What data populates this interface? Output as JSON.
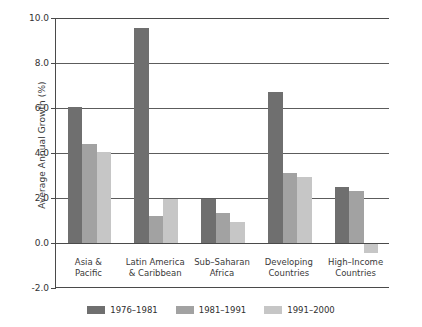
{
  "chart_data": {
    "type": "bar",
    "title": "",
    "xlabel": "",
    "ylabel": "Average Annual Growth (%)",
    "ylim": [
      -2.0,
      10.0
    ],
    "ytick_values": [
      10.0,
      8.0,
      6.0,
      4.0,
      2.0,
      0.0,
      -2.0
    ],
    "ytick_labels": [
      "10.0",
      "8.0",
      "6.0",
      "4.0",
      "2.0",
      "0.0",
      "-2.0"
    ],
    "grid": "horizontal",
    "legend_position": "bottom",
    "categories": [
      "Asia &\nPacific",
      "Latin America\n& Caribbean",
      "Sub-Saharan\nAfrica",
      "Developing\nCountries",
      "High-Income\nCountries"
    ],
    "category_lines": [
      [
        "Asia &",
        "Pacific"
      ],
      [
        "Latin America",
        "& Caribbean"
      ],
      [
        "Sub–Saharan",
        "Africa"
      ],
      [
        "Developing",
        "Countries"
      ],
      [
        "High–Income",
        "Countries"
      ]
    ],
    "series": [
      {
        "name": "1976–1981",
        "color": "#6f6f6f",
        "values": [
          6.05,
          9.55,
          1.95,
          6.7,
          2.5
        ]
      },
      {
        "name": "1981–1991",
        "color": "#a2a2a2",
        "values": [
          4.4,
          1.2,
          1.35,
          3.1,
          2.3
        ]
      },
      {
        "name": "1991–2000",
        "color": "#c6c6c6",
        "values": [
          4.05,
          1.95,
          0.95,
          2.95,
          -0.45
        ]
      }
    ]
  },
  "colors": {
    "axis": "#4a4a4a",
    "gridline": "#5c5c5c",
    "background": "#ffffff",
    "text": "#2f2f2f"
  }
}
